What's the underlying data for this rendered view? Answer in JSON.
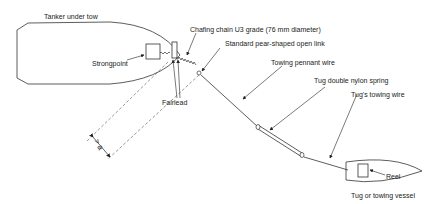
{
  "diagram": {
    "labels": {
      "tanker": "Tanker under tow",
      "strongpoint": "Strongpoint",
      "fairlead": "Fairlead",
      "chafing_chain": "Chafing chain U3 grade (76 mm diameter)",
      "pear_link": "Standard pear-shaped open link",
      "pennant_wire": "Towing pennant wire",
      "nylon_spring": "Tug double nylon spring",
      "towing_wire": "Tug's towing wire",
      "reel": "Reel",
      "tug": "Tug or towing vessel",
      "dimension": "> a"
    }
  }
}
